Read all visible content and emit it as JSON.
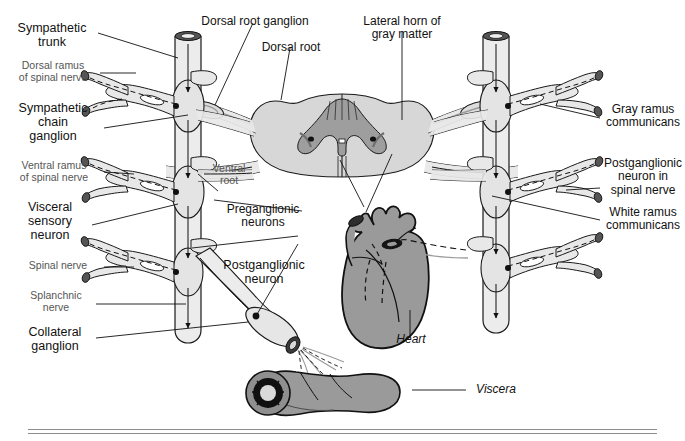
{
  "figure": {
    "type": "anatomical-diagram",
    "colors": {
      "background": "#ffffff",
      "nerve_fill": "#e8e8e8",
      "nerve_stroke": "#1a1a1a",
      "white_matter": "#d7d7d7",
      "gray_matter": "#9e9e9e",
      "organ_fill": "#9a9a9a",
      "organ_stroke": "#111111",
      "leader_line": "#111111",
      "rule": "#8d8d8d",
      "label_major": "#111111",
      "label_minor": "#555555"
    }
  },
  "labels": {
    "left": [
      {
        "id": "sympathetic-trunk",
        "text": "Sympathetic\ntrunk",
        "style": "major"
      },
      {
        "id": "dorsal-ramus",
        "text": "Dorsal ramus\nof spinal nerve",
        "style": "minor"
      },
      {
        "id": "sympathetic-chain-ganglion",
        "text": "Sympathetic\nchain\nganglion",
        "style": "major"
      },
      {
        "id": "ventral-ramus",
        "text": "Ventral ramus\nof spinal nerve",
        "style": "minor"
      },
      {
        "id": "visceral-sensory-neuron",
        "text": "Visceral\nsensory\nneuron",
        "style": "major"
      },
      {
        "id": "spinal-nerve",
        "text": "Spinal nerve",
        "style": "minor"
      },
      {
        "id": "splanchnic-nerve",
        "text": "Splanchnic\nnerve",
        "style": "minor"
      },
      {
        "id": "collateral-ganglion",
        "text": "Collateral\nganglion",
        "style": "major"
      }
    ],
    "top": [
      {
        "id": "dorsal-root-ganglion",
        "text": "Dorsal root ganglion",
        "style": "mid"
      },
      {
        "id": "dorsal-root",
        "text": "Dorsal root",
        "style": "mid"
      },
      {
        "id": "lateral-horn",
        "text": "Lateral horn of\ngray matter",
        "style": "mid"
      }
    ],
    "center": [
      {
        "id": "ventral-root",
        "text": "Ventral\nroot",
        "style": "minor"
      },
      {
        "id": "preganglionic-neurons",
        "text": "Preganglionic\nneurons",
        "style": "mid"
      },
      {
        "id": "postganglionic-neuron",
        "text": "Postganglionic\nneuron",
        "style": "major"
      }
    ],
    "right": [
      {
        "id": "gray-ramus-communicans",
        "text": "Gray ramus\ncommunicans",
        "style": "mid"
      },
      {
        "id": "postganglionic-neuron-in-spinal-nerve",
        "text": "Postganglionic\nneuron in\nspinal nerve",
        "style": "mid"
      },
      {
        "id": "white-ramus-communicans",
        "text": "White ramus\ncommunicans",
        "style": "mid"
      }
    ],
    "organs": [
      {
        "id": "heart",
        "text": "Heart",
        "style": "ital"
      },
      {
        "id": "viscera",
        "text": "Viscera",
        "style": "ital"
      }
    ]
  }
}
